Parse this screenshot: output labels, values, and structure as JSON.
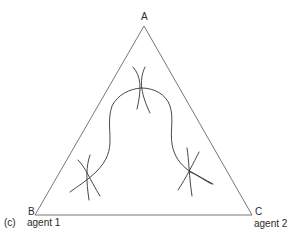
{
  "figure": {
    "panel_label": "(c)",
    "vertices": {
      "top": {
        "label": "A"
      },
      "bottom_left": {
        "label": "B",
        "sublabel": "agent 1"
      },
      "bottom_right": {
        "label": "C",
        "sublabel": "agent 2"
      }
    },
    "elements": [
      {
        "type": "triangle",
        "description": "Simplex triangle with vertices A, B, C"
      },
      {
        "type": "curve",
        "description": "Wavy arch-shaped curve from lower-left through top-centre to lower-right inside the triangle"
      },
      {
        "type": "crossing-marks",
        "count": 3,
        "positions": [
          "top-centre",
          "lower-left",
          "lower-right"
        ],
        "description": "Pairs of crossing arcs (indifference curves) tangent to the main curve"
      }
    ],
    "colors": {
      "line": "#333333",
      "triangle": "#555555",
      "text": "#2a2a2a",
      "background": "#ffffff"
    }
  }
}
